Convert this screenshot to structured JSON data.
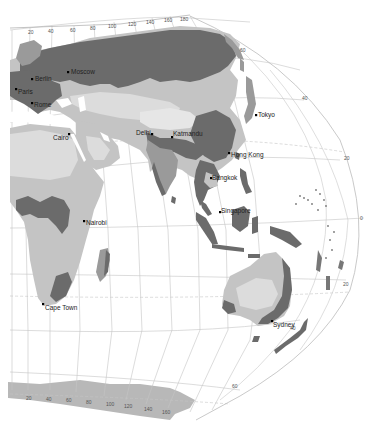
{
  "header": {
    "text": ""
  },
  "colors": {
    "ocean": "#ffffff",
    "land_dark": "#6b6b6b",
    "land_mid": "#9a9a9a",
    "land_light": "#c4c4c4",
    "land_pale": "#dcdcdc",
    "grid": "#bdbdbd",
    "antarctica": "#b8b8b8"
  },
  "cities": [
    {
      "name": "Moscow"
    },
    {
      "name": "Berlin"
    },
    {
      "name": "Paris"
    },
    {
      "name": "Rome"
    },
    {
      "name": "Cairo"
    },
    {
      "name": "Delhi"
    },
    {
      "name": "Katmandu"
    },
    {
      "name": "Tokyo"
    },
    {
      "name": "Hong Kong"
    },
    {
      "name": "Bangkok"
    },
    {
      "name": "Singapore"
    },
    {
      "name": "Nairobi"
    },
    {
      "name": "Cape Town"
    },
    {
      "name": "Sydney"
    }
  ],
  "longitude_labels_top": [
    "20",
    "40",
    "60",
    "80",
    "100",
    "120",
    "140",
    "160",
    "180"
  ],
  "longitude_labels_bottom": [
    "20",
    "40",
    "60",
    "80",
    "100",
    "120",
    "140",
    "160"
  ],
  "latitude_labels": [
    "60",
    "40",
    "20",
    "0",
    "20",
    "40",
    "60"
  ]
}
